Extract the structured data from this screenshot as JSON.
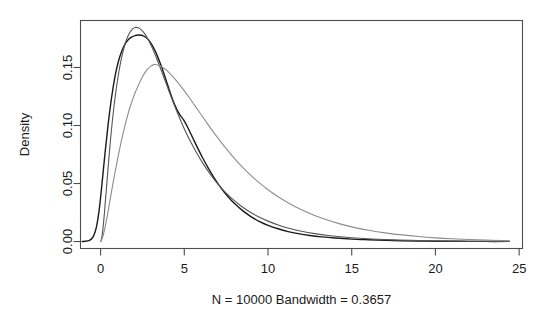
{
  "chart_data": {
    "type": "line",
    "title": "",
    "subtitle": "",
    "xlabel": "N = 10000   Bandwidth = 0.3657",
    "ylabel": "Density",
    "xlim": [
      -1.2,
      25.2
    ],
    "ylim": [
      -0.006,
      0.1905
    ],
    "grid": false,
    "legend": "none",
    "x_ticks": [
      0,
      5,
      10,
      15,
      20,
      25
    ],
    "x_tick_labels": [
      "0",
      "5",
      "10",
      "15",
      "20",
      "25"
    ],
    "y_ticks": [
      0.0,
      0.05,
      0.1,
      0.15
    ],
    "y_tick_labels": [
      "0.00",
      "0.05",
      "0.10",
      "0.15"
    ],
    "series": [
      {
        "name": "density-curve-black",
        "color": "#1a1a1a",
        "width": 1.4,
        "peak_x": 2.4,
        "peak_y": 0.178,
        "points": [
          [
            -1.1,
            0.0
          ],
          [
            -0.9,
            0.0002
          ],
          [
            -0.7,
            0.0008
          ],
          [
            -0.55,
            0.0022
          ],
          [
            -0.4,
            0.0055
          ],
          [
            -0.25,
            0.0125
          ],
          [
            -0.1,
            0.0255
          ],
          [
            0.05,
            0.045
          ],
          [
            0.25,
            0.074
          ],
          [
            0.45,
            0.101
          ],
          [
            0.65,
            0.1235
          ],
          [
            0.85,
            0.1415
          ],
          [
            1.05,
            0.1545
          ],
          [
            1.25,
            0.1635
          ],
          [
            1.45,
            0.17
          ],
          [
            1.65,
            0.174
          ],
          [
            1.85,
            0.1762
          ],
          [
            2.05,
            0.1775
          ],
          [
            2.25,
            0.178
          ],
          [
            2.45,
            0.1778
          ],
          [
            2.65,
            0.1765
          ],
          [
            2.85,
            0.174
          ],
          [
            3.05,
            0.17
          ],
          [
            3.3,
            0.163
          ],
          [
            3.55,
            0.154
          ],
          [
            3.8,
            0.144
          ],
          [
            4.05,
            0.133
          ],
          [
            4.3,
            0.1225
          ],
          [
            4.55,
            0.114
          ],
          [
            4.75,
            0.109
          ],
          [
            4.95,
            0.105
          ],
          [
            5.2,
            0.0985
          ],
          [
            5.5,
            0.0895
          ],
          [
            5.8,
            0.0805
          ],
          [
            6.1,
            0.072
          ],
          [
            6.45,
            0.0628
          ],
          [
            6.8,
            0.0545
          ],
          [
            7.2,
            0.046
          ],
          [
            7.6,
            0.0388
          ],
          [
            8.0,
            0.0327
          ],
          [
            8.5,
            0.0264
          ],
          [
            9.0,
            0.0213
          ],
          [
            9.5,
            0.0172
          ],
          [
            10.0,
            0.014
          ],
          [
            10.6,
            0.011
          ],
          [
            11.2,
            0.0086
          ],
          [
            11.8,
            0.0068
          ],
          [
            12.5,
            0.0052
          ],
          [
            13.2,
            0.004
          ],
          [
            14.0,
            0.003
          ],
          [
            15.0,
            0.0021
          ],
          [
            16.0,
            0.0015
          ],
          [
            17.0,
            0.001
          ],
          [
            18.0,
            0.0007
          ],
          [
            19.0,
            0.0005
          ],
          [
            20.0,
            0.0003
          ],
          [
            21.5,
            0.0002
          ],
          [
            23.0,
            0.0001
          ],
          [
            24.4,
            0.0001
          ]
        ]
      },
      {
        "name": "density-curve-gray-tall",
        "color": "#555555",
        "width": 1.1,
        "peak_x": 2.0,
        "peak_y": 0.1845,
        "points": [
          [
            0.02,
            0.0
          ],
          [
            0.1,
            0.006
          ],
          [
            0.22,
            0.023
          ],
          [
            0.36,
            0.048
          ],
          [
            0.52,
            0.076
          ],
          [
            0.7,
            0.1035
          ],
          [
            0.9,
            0.128
          ],
          [
            1.1,
            0.147
          ],
          [
            1.3,
            0.1615
          ],
          [
            1.5,
            0.172
          ],
          [
            1.7,
            0.179
          ],
          [
            1.9,
            0.183
          ],
          [
            2.05,
            0.1845
          ],
          [
            2.25,
            0.1842
          ],
          [
            2.45,
            0.1822
          ],
          [
            2.65,
            0.1788
          ],
          [
            2.85,
            0.174
          ],
          [
            3.1,
            0.1665
          ],
          [
            3.35,
            0.1578
          ],
          [
            3.6,
            0.1485
          ],
          [
            3.85,
            0.1388
          ],
          [
            4.1,
            0.129
          ],
          [
            4.35,
            0.1195
          ],
          [
            4.6,
            0.1105
          ],
          [
            4.85,
            0.102
          ],
          [
            5.15,
            0.0925
          ],
          [
            5.45,
            0.084
          ],
          [
            5.8,
            0.0748
          ],
          [
            6.15,
            0.0665
          ],
          [
            6.55,
            0.058
          ],
          [
            6.95,
            0.0505
          ],
          [
            7.4,
            0.0432
          ],
          [
            7.85,
            0.037
          ],
          [
            8.35,
            0.0311
          ],
          [
            8.85,
            0.0261
          ],
          [
            9.4,
            0.0216
          ],
          [
            10.0,
            0.0176
          ],
          [
            10.65,
            0.0141
          ],
          [
            11.3,
            0.0113
          ],
          [
            12.0,
            0.0089
          ],
          [
            12.8,
            0.0068
          ],
          [
            13.6,
            0.0052
          ],
          [
            14.5,
            0.0039
          ],
          [
            15.5,
            0.0028
          ],
          [
            16.5,
            0.002
          ],
          [
            17.5,
            0.0014
          ],
          [
            18.5,
            0.001
          ],
          [
            20.0,
            0.0006
          ],
          [
            21.5,
            0.0003
          ],
          [
            23.0,
            0.0002
          ],
          [
            24.4,
            0.0001
          ]
        ]
      },
      {
        "name": "density-curve-gray-wide",
        "color": "#8d8d8d",
        "width": 1.1,
        "peak_x": 3.1,
        "peak_y": 0.1525,
        "points": [
          [
            0.02,
            0.0
          ],
          [
            0.15,
            0.005
          ],
          [
            0.32,
            0.016
          ],
          [
            0.52,
            0.032
          ],
          [
            0.75,
            0.051
          ],
          [
            1.0,
            0.07
          ],
          [
            1.25,
            0.0875
          ],
          [
            1.5,
            0.1025
          ],
          [
            1.75,
            0.1155
          ],
          [
            2.0,
            0.126
          ],
          [
            2.25,
            0.1345
          ],
          [
            2.5,
            0.142
          ],
          [
            2.75,
            0.1478
          ],
          [
            3.0,
            0.1512
          ],
          [
            3.2,
            0.1525
          ],
          [
            3.45,
            0.152
          ],
          [
            3.7,
            0.1502
          ],
          [
            3.95,
            0.1475
          ],
          [
            4.25,
            0.1432
          ],
          [
            4.55,
            0.1382
          ],
          [
            4.9,
            0.1318
          ],
          [
            5.25,
            0.125
          ],
          [
            5.6,
            0.1178
          ],
          [
            6.0,
            0.1095
          ],
          [
            6.4,
            0.1012
          ],
          [
            6.85,
            0.0922
          ],
          [
            7.3,
            0.0838
          ],
          [
            7.8,
            0.075
          ],
          [
            8.3,
            0.0668
          ],
          [
            8.85,
            0.0588
          ],
          [
            9.4,
            0.0516
          ],
          [
            10.0,
            0.0446
          ],
          [
            10.65,
            0.0381
          ],
          [
            11.3,
            0.0325
          ],
          [
            12.0,
            0.0273
          ],
          [
            12.75,
            0.0226
          ],
          [
            13.5,
            0.0187
          ],
          [
            14.3,
            0.0152
          ],
          [
            15.2,
            0.012
          ],
          [
            16.1,
            0.0095
          ],
          [
            17.0,
            0.0075
          ],
          [
            18.0,
            0.0057
          ],
          [
            19.0,
            0.0043
          ],
          [
            20.0,
            0.0032
          ],
          [
            21.0,
            0.0024
          ],
          [
            22.0,
            0.0018
          ],
          [
            23.0,
            0.0013
          ],
          [
            24.0,
            0.0009
          ],
          [
            24.4,
            0.0008
          ]
        ]
      }
    ]
  },
  "axes": {
    "box_color": "#4d4d4d",
    "tick_color": "#4d4d4d"
  }
}
